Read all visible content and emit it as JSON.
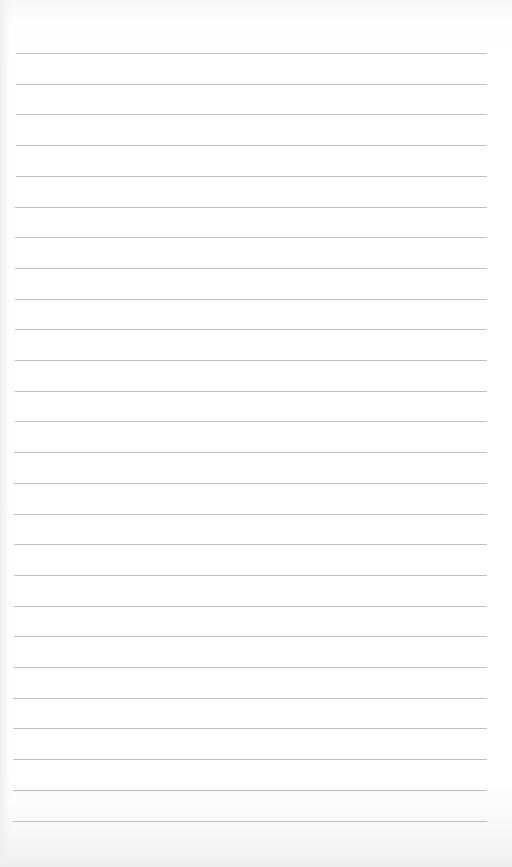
{
  "page": {
    "type": "lined-notebook-paper",
    "paper_color": "#ffffff",
    "line_color": "#b8b8b8",
    "line_count": 26,
    "first_line_y": 53,
    "line_spacing": 30.7,
    "line_left_x": 16,
    "line_right_x": 487
  }
}
